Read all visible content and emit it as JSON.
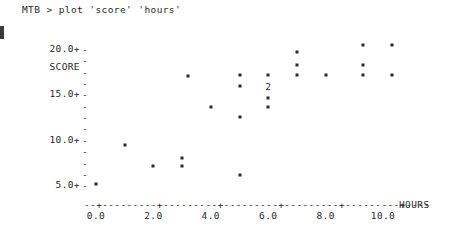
{
  "terminal": {
    "prompt": "MTB > ",
    "command": "plot 'score' 'hours'",
    "full_line": "MTB > plot 'score' 'hours'"
  },
  "chart_data": {
    "type": "scatter",
    "title": "",
    "xlabel": "HOURS",
    "ylabel": "SCORE",
    "xlim": [
      -0.5,
      11.0
    ],
    "ylim": [
      4.0,
      20.5
    ],
    "grid": false,
    "legend": false,
    "marker": "*",
    "x_ticks": [
      "0.0",
      "2.0",
      "4.0",
      "6.0",
      "8.0",
      "10.0"
    ],
    "x_tick_values": [
      0.0,
      2.0,
      4.0,
      6.0,
      8.0,
      10.0
    ],
    "y_ticks": [
      "20.0+",
      "15.0+",
      "10.0+",
      "5.0+"
    ],
    "y_tick_values": [
      20.0,
      15.0,
      10.0,
      5.0
    ],
    "axis_line": "--+---------+---------+---------+---------+---------+----",
    "overlap_label": "2",
    "points": [
      {
        "x": 0.0,
        "y": 5.0,
        "label": "*"
      },
      {
        "x": 1.0,
        "y": 9.3,
        "label": "*"
      },
      {
        "x": 2.0,
        "y": 7.0,
        "label": "*"
      },
      {
        "x": 3.0,
        "y": 7.9,
        "label": "*"
      },
      {
        "x": 3.0,
        "y": 7.0,
        "label": "*"
      },
      {
        "x": 3.2,
        "y": 16.9,
        "label": "*"
      },
      {
        "x": 4.0,
        "y": 13.5,
        "label": "*"
      },
      {
        "x": 5.0,
        "y": 17.0,
        "label": "*"
      },
      {
        "x": 5.0,
        "y": 15.8,
        "label": "*"
      },
      {
        "x": 5.0,
        "y": 12.4,
        "label": "*"
      },
      {
        "x": 5.0,
        "y": 6.0,
        "label": "*"
      },
      {
        "x": 6.0,
        "y": 17.0,
        "label": "*"
      },
      {
        "x": 6.0,
        "y": 15.7,
        "label": "2"
      },
      {
        "x": 6.0,
        "y": 14.5,
        "label": "*"
      },
      {
        "x": 6.0,
        "y": 13.5,
        "label": "*"
      },
      {
        "x": 7.0,
        "y": 19.5,
        "label": "*"
      },
      {
        "x": 7.0,
        "y": 18.1,
        "label": "*"
      },
      {
        "x": 7.0,
        "y": 17.0,
        "label": "*"
      },
      {
        "x": 8.0,
        "y": 17.0,
        "label": "*"
      },
      {
        "x": 9.3,
        "y": 20.3,
        "label": "*"
      },
      {
        "x": 9.3,
        "y": 18.1,
        "label": "*"
      },
      {
        "x": 9.3,
        "y": 17.0,
        "label": "*"
      },
      {
        "x": 10.3,
        "y": 20.3,
        "label": "*"
      },
      {
        "x": 10.3,
        "y": 17.0,
        "label": "*"
      }
    ]
  },
  "colors": {
    "background": "#ffffff",
    "text": "#272727",
    "marker": "#2a2a2a"
  }
}
